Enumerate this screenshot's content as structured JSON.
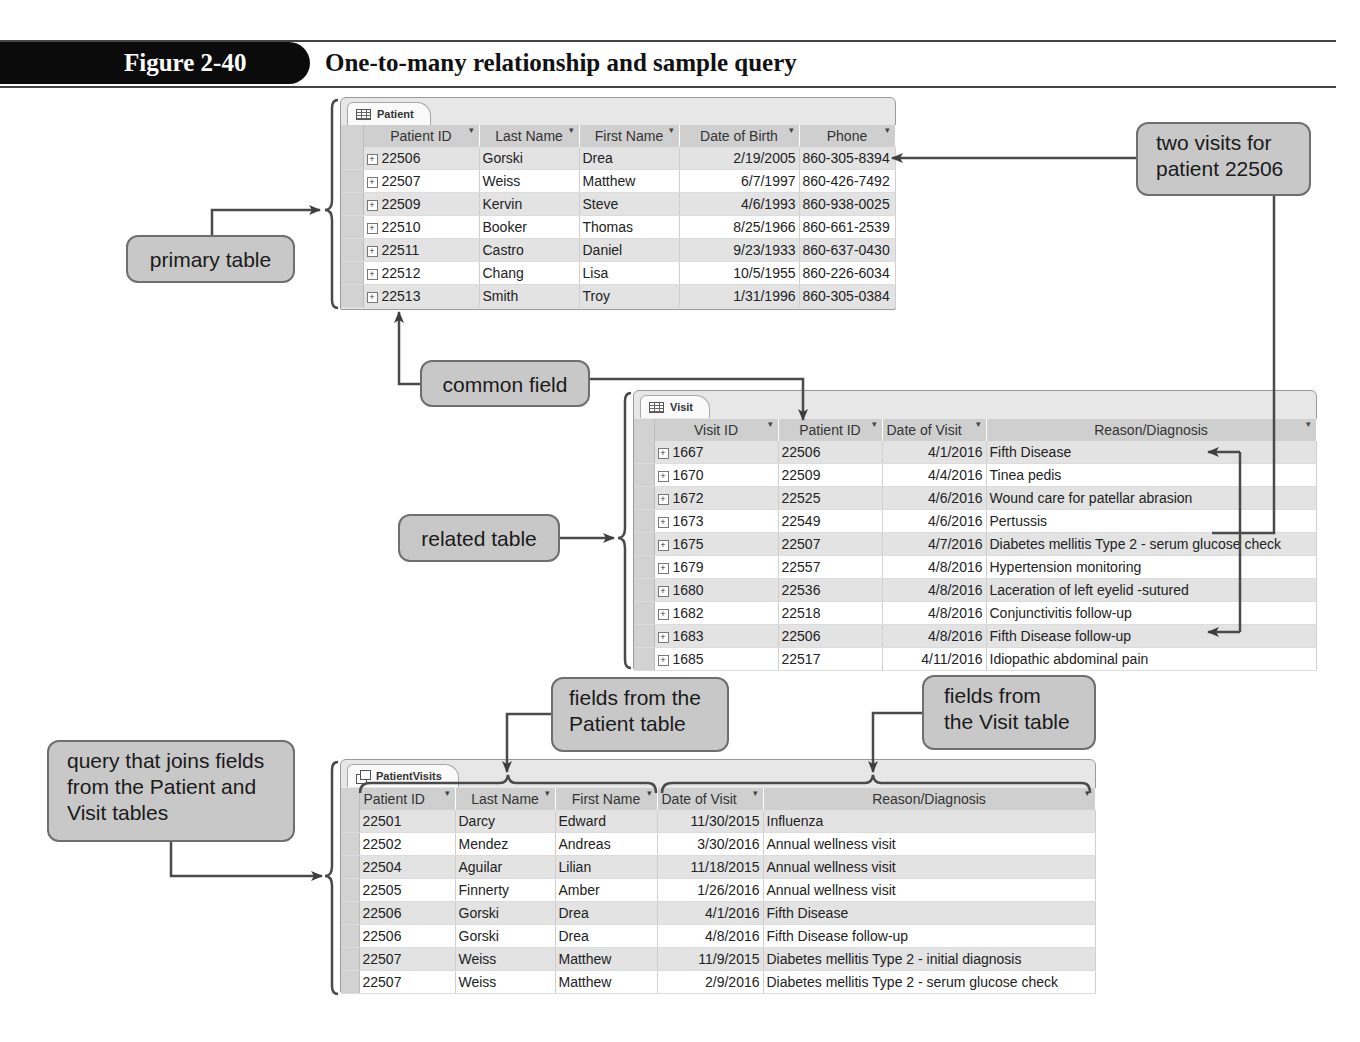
{
  "figure": {
    "label": "Figure 2-40",
    "title": "One-to-many relationship and sample query"
  },
  "patient_table": {
    "tab": "Patient",
    "icon": "table-icon",
    "columns": [
      "Patient ID",
      "Last Name",
      "First Name",
      "Date of Birth",
      "Phone"
    ],
    "rows": [
      [
        "22506",
        "Gorski",
        "Drea",
        "2/19/2005",
        "860-305-8394"
      ],
      [
        "22507",
        "Weiss",
        "Matthew",
        "6/7/1997",
        "860-426-7492"
      ],
      [
        "22509",
        "Kervin",
        "Steve",
        "4/6/1993",
        "860-938-0025"
      ],
      [
        "22510",
        "Booker",
        "Thomas",
        "8/25/1966",
        "860-661-2539"
      ],
      [
        "22511",
        "Castro",
        "Daniel",
        "9/23/1933",
        "860-637-0430"
      ],
      [
        "22512",
        "Chang",
        "Lisa",
        "10/5/1955",
        "860-226-6034"
      ],
      [
        "22513",
        "Smith",
        "Troy",
        "1/31/1996",
        "860-305-0384"
      ]
    ]
  },
  "visit_table": {
    "tab": "Visit",
    "icon": "table-icon",
    "columns": [
      "Visit ID",
      "Patient ID",
      "Date of Visit",
      "Reason/Diagnosis"
    ],
    "rows": [
      [
        "1667",
        "22506",
        "4/1/2016",
        "Fifth Disease"
      ],
      [
        "1670",
        "22509",
        "4/4/2016",
        "Tinea pedis"
      ],
      [
        "1672",
        "22525",
        "4/6/2016",
        "Wound care for patellar abrasion"
      ],
      [
        "1673",
        "22549",
        "4/6/2016",
        "Pertussis"
      ],
      [
        "1675",
        "22507",
        "4/7/2016",
        "Diabetes mellitis Type 2 - serum glucose check"
      ],
      [
        "1679",
        "22557",
        "4/8/2016",
        "Hypertension monitoring"
      ],
      [
        "1680",
        "22536",
        "4/8/2016",
        "Laceration of left eyelid -sutured"
      ],
      [
        "1682",
        "22518",
        "4/8/2016",
        "Conjunctivitis follow-up"
      ],
      [
        "1683",
        "22506",
        "4/8/2016",
        "Fifth Disease follow-up"
      ],
      [
        "1685",
        "22517",
        "4/11/2016",
        "Idiopathic abdominal pain"
      ]
    ]
  },
  "query_table": {
    "tab": "PatientVisits",
    "icon": "query-icon",
    "columns": [
      "Patient ID",
      "Last Name",
      "First Name",
      "Date of Visit",
      "Reason/Diagnosis"
    ],
    "rows": [
      [
        "22501",
        "Darcy",
        "Edward",
        "11/30/2015",
        "Influenza"
      ],
      [
        "22502",
        "Mendez",
        "Andreas",
        "3/30/2016",
        "Annual wellness visit"
      ],
      [
        "22504",
        "Aguilar",
        "Lilian",
        "11/18/2015",
        "Annual wellness visit"
      ],
      [
        "22505",
        "Finnerty",
        "Amber",
        "1/26/2016",
        "Annual wellness visit"
      ],
      [
        "22506",
        "Gorski",
        "Drea",
        "4/1/2016",
        "Fifth Disease"
      ],
      [
        "22506",
        "Gorski",
        "Drea",
        "4/8/2016",
        "Fifth Disease follow-up"
      ],
      [
        "22507",
        "Weiss",
        "Matthew",
        "11/9/2015",
        "Diabetes mellitis Type 2 - initial diagnosis"
      ],
      [
        "22507",
        "Weiss",
        "Matthew",
        "2/9/2016",
        "Diabetes mellitis Type 2 - serum glucose check"
      ]
    ]
  },
  "callouts": {
    "primary_table": "primary table",
    "two_visits": [
      "two visits for",
      "patient 22506"
    ],
    "common_field": "common field",
    "related_table": "related table",
    "fields_patient": [
      "fields from the",
      "Patient table"
    ],
    "fields_visit": [
      "fields from",
      "the Visit table"
    ],
    "query_joins": [
      "query that joins fields",
      "from the Patient and",
      "Visit tables"
    ]
  },
  "colors": {
    "figure_bar": "#0b0b0b",
    "callout_fill": "#c8c8c8",
    "header_fill": "#cfcfcf",
    "alt_row": "#e3e3e3",
    "line": "#4a4a4a"
  }
}
